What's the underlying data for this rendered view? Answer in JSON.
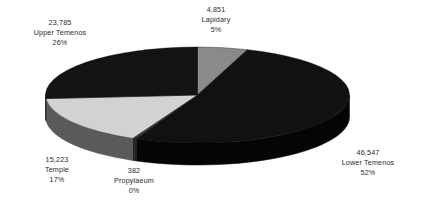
{
  "chart_data": {
    "type": "pie",
    "title": "",
    "subtitle": "",
    "legend_position": "none",
    "grid": false,
    "three_d": true,
    "total": 90788,
    "categories": [
      "Lapidary",
      "Lower Temenos",
      "Propylaeum",
      "Temple",
      "Upper Temenos"
    ],
    "values": [
      4851,
      46547,
      382,
      15223,
      23785
    ],
    "value_labels": [
      "4,851",
      "46,547",
      "382",
      "15,223",
      "23,785"
    ],
    "percent_labels": [
      "5%",
      "52%",
      "0%",
      "17%",
      "26%"
    ],
    "percents": [
      5,
      52,
      0,
      17,
      26
    ],
    "slices": [
      {
        "name": "Lapidary",
        "value": 4851,
        "value_label": "4,851",
        "percent": 5,
        "percent_label": "5%",
        "color": "#8a8a8a",
        "side_color": "#6e6e6e",
        "start_angle": 0,
        "end_angle": 19.2
      },
      {
        "name": "Lower Temenos",
        "value": 46547,
        "value_label": "46,547",
        "percent": 52,
        "percent_label": "52%",
        "color": "#111111",
        "side_color": "#050505",
        "start_angle": 19.2,
        "end_angle": 203.8
      },
      {
        "name": "Propylaeum",
        "value": 382,
        "value_label": "382",
        "percent": 0,
        "percent_label": "0%",
        "color": "#333333",
        "side_color": "#262626",
        "start_angle": 203.8,
        "end_angle": 205.3
      },
      {
        "name": "Temple",
        "value": 15223,
        "value_label": "15,223",
        "percent": 17,
        "percent_label": "17%",
        "color": "#d2d2d2",
        "side_color": "#5a5a5a",
        "start_angle": 205.3,
        "end_angle": 265.7
      },
      {
        "name": "Upper Temenos",
        "value": 23785,
        "value_label": "23,785",
        "percent": 26,
        "percent_label": "26%",
        "color": "#131313",
        "side_color": "#0a0a0a",
        "start_angle": 265.7,
        "end_angle": 360
      }
    ],
    "text_color": "#2b2b2b",
    "background_color": "#ffffff"
  }
}
